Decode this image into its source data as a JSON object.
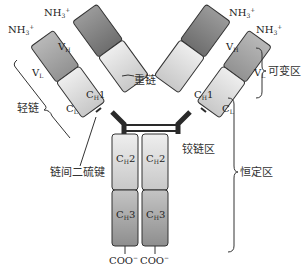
{
  "diagram": {
    "termini": {
      "n_terminus": "NH",
      "n_sub": "3",
      "n_sup": "+",
      "c_terminus": "COO",
      "c_sup": "−"
    },
    "domains": {
      "vh": "V",
      "vh_sub": "H",
      "vl": "V",
      "vl_sub": "L",
      "ch1": "C",
      "ch1_sub": "H",
      "ch1_num": "1",
      "cl": "C",
      "cl_sub": "L",
      "ch2": "C",
      "ch2_sub": "H",
      "ch2_num": "2",
      "ch3": "C",
      "ch3_sub": "H",
      "ch3_num": "3"
    },
    "labels": {
      "heavy_chain": "重链",
      "light_chain": "轻链",
      "variable_region": "可变区",
      "constant_region": "恒定区",
      "hinge_region": "铰链区",
      "disulfide_bond": "链间二硫键"
    },
    "colors": {
      "vh": "#8a8a8a",
      "vl": "#a8a8a8",
      "ch1": "#dcdcdc",
      "cl": "#cfcfcf",
      "ch2": "#d6d6d6",
      "ch3": "#b4b4b4",
      "outline": "#333333",
      "hinge": "#2a2a2a"
    }
  }
}
